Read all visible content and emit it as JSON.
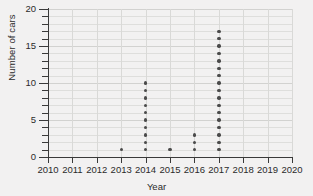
{
  "chart_data": {
    "type": "scatter",
    "plot_style": "dot-plot",
    "title": "",
    "subtitle": "",
    "xlabel": "Year",
    "ylabel": "Number of cars",
    "xlim": [
      2010,
      2020
    ],
    "ylim": [
      0,
      20
    ],
    "x_tick_labels": [
      "2010",
      "2011",
      "2012",
      "2013",
      "2014",
      "2015",
      "2016",
      "2017",
      "2018",
      "2019",
      "2020"
    ],
    "x_ticks": [
      2010,
      2011,
      2012,
      2013,
      2014,
      2015,
      2016,
      2017,
      2018,
      2019,
      2020
    ],
    "y_tick_labels": [
      "0",
      "5",
      "10",
      "15",
      "20"
    ],
    "y_ticks_major": [
      0,
      5,
      10,
      15,
      20
    ],
    "y_ticks_minor": [
      1,
      2,
      3,
      4,
      6,
      7,
      8,
      9,
      11,
      12,
      13,
      14,
      16,
      17,
      18,
      19
    ],
    "grid": true,
    "grid_horizontal_step": 1,
    "grid_vertical_step": 1,
    "legend": null,
    "legend_position": "none",
    "annotations": [],
    "columns": [
      {
        "x": 2010,
        "label": "2010",
        "count": 0,
        "values": []
      },
      {
        "x": 2011,
        "label": "2011",
        "count": 0,
        "values": []
      },
      {
        "x": 2012,
        "label": "2012",
        "count": 0,
        "values": []
      },
      {
        "x": 2013,
        "label": "2013",
        "count": 1,
        "values": [
          1
        ]
      },
      {
        "x": 2014,
        "label": "2014",
        "count": 10,
        "values": [
          1,
          2,
          3,
          4,
          5,
          6,
          7,
          8,
          9,
          10
        ]
      },
      {
        "x": 2015,
        "label": "2015",
        "count": 1,
        "values": [
          1
        ]
      },
      {
        "x": 2016,
        "label": "2016",
        "count": 3,
        "values": [
          1,
          2,
          3
        ]
      },
      {
        "x": 2017,
        "label": "2017",
        "count": 17,
        "values": [
          1,
          2,
          3,
          4,
          5,
          6,
          7,
          8,
          9,
          10,
          11,
          12,
          13,
          14,
          15,
          16,
          17
        ]
      },
      {
        "x": 2018,
        "label": "2018",
        "count": 0,
        "values": []
      },
      {
        "x": 2019,
        "label": "2019",
        "count": 0,
        "values": []
      },
      {
        "x": 2020,
        "label": "2020",
        "count": 0,
        "values": []
      }
    ],
    "points": [
      {
        "x": 2013,
        "y": 1
      },
      {
        "x": 2014,
        "y": 1
      },
      {
        "x": 2014,
        "y": 2
      },
      {
        "x": 2014,
        "y": 3
      },
      {
        "x": 2014,
        "y": 4
      },
      {
        "x": 2014,
        "y": 5
      },
      {
        "x": 2014,
        "y": 6
      },
      {
        "x": 2014,
        "y": 7
      },
      {
        "x": 2014,
        "y": 8
      },
      {
        "x": 2014,
        "y": 9
      },
      {
        "x": 2014,
        "y": 10
      },
      {
        "x": 2015,
        "y": 1
      },
      {
        "x": 2016,
        "y": 1
      },
      {
        "x": 2016,
        "y": 2
      },
      {
        "x": 2016,
        "y": 3
      },
      {
        "x": 2017,
        "y": 1
      },
      {
        "x": 2017,
        "y": 2
      },
      {
        "x": 2017,
        "y": 3
      },
      {
        "x": 2017,
        "y": 4
      },
      {
        "x": 2017,
        "y": 5
      },
      {
        "x": 2017,
        "y": 6
      },
      {
        "x": 2017,
        "y": 7
      },
      {
        "x": 2017,
        "y": 8
      },
      {
        "x": 2017,
        "y": 9
      },
      {
        "x": 2017,
        "y": 10
      },
      {
        "x": 2017,
        "y": 11
      },
      {
        "x": 2017,
        "y": 12
      },
      {
        "x": 2017,
        "y": 13
      },
      {
        "x": 2017,
        "y": 14
      },
      {
        "x": 2017,
        "y": 15
      },
      {
        "x": 2017,
        "y": 16
      },
      {
        "x": 2017,
        "y": 17
      }
    ]
  },
  "colors": {
    "background": "#f2f1f1",
    "dot": "#4a4a4a",
    "axis": "#3a3a3a",
    "grid_minor": "#dededc",
    "grid_major": "#d2d2d0",
    "text": "#2b2b2b"
  }
}
